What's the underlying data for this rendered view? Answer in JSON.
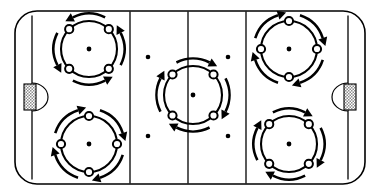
{
  "diagram": {
    "type": "rink-drill",
    "surface": {
      "name": "ice-surface",
      "fill_color": "#ffffff",
      "border_color": "#000000",
      "corner_radius": 22
    },
    "markings": {
      "goal_lines": [
        {
          "name": "goal-line-left",
          "x": 32
        },
        {
          "name": "goal-line-right",
          "x": 348
        }
      ],
      "blue_lines": [
        {
          "name": "blue-line-left",
          "x": 130
        },
        {
          "name": "blue-line-right",
          "x": 246
        }
      ],
      "center_line": {
        "name": "center-line",
        "x": 188
      },
      "neutral_zone_dots": [
        {
          "name": "neutral-dot-top-left",
          "x": 148,
          "y": 57
        },
        {
          "name": "neutral-dot-top-right",
          "x": 228,
          "y": 57
        },
        {
          "name": "neutral-dot-bottom-left",
          "x": 148,
          "y": 136
        },
        {
          "name": "neutral-dot-bottom-right",
          "x": 228,
          "y": 136
        }
      ],
      "goals": [
        {
          "name": "goal-left",
          "x": 24,
          "y": 84,
          "width": 12,
          "height": 26,
          "crease_side": "right"
        },
        {
          "name": "goal-right",
          "x": 344,
          "y": 84,
          "width": 12,
          "height": 26,
          "crease_side": "left"
        }
      ]
    },
    "faceoff_circles": [
      {
        "name": "faceoff-circle-top-left",
        "zone": "offensive-zone-upper-left",
        "cx": 89,
        "cy": 49,
        "r": 28,
        "marker_orientation": "diagonal",
        "rotation": "counter-clockwise",
        "player_count": 4,
        "arrow_count": 4
      },
      {
        "name": "faceoff-circle-bottom-left",
        "zone": "offensive-zone-lower-left",
        "cx": 89,
        "cy": 144,
        "r": 28,
        "marker_orientation": "cardinal",
        "rotation": "clockwise",
        "player_count": 4,
        "arrow_count": 4
      },
      {
        "name": "faceoff-circle-center",
        "zone": "center-ice",
        "cx": 193,
        "cy": 95,
        "r": 29,
        "marker_orientation": "diagonal",
        "rotation": "clockwise",
        "player_count": 4,
        "arrow_count": 4
      },
      {
        "name": "faceoff-circle-top-right",
        "zone": "defensive-zone-upper-right",
        "cx": 289,
        "cy": 49,
        "r": 28,
        "marker_orientation": "cardinal",
        "rotation": "clockwise",
        "player_count": 4,
        "arrow_count": 4
      },
      {
        "name": "faceoff-circle-bottom-right",
        "zone": "defensive-zone-lower-right",
        "cx": 289,
        "cy": 144,
        "r": 28,
        "marker_orientation": "diagonal",
        "rotation": "clockwise",
        "player_count": 4,
        "arrow_count": 4
      }
    ],
    "legend": {
      "player_marker": "open-circle",
      "motion": "curved-arrow",
      "stroke_color": "#000000"
    }
  }
}
